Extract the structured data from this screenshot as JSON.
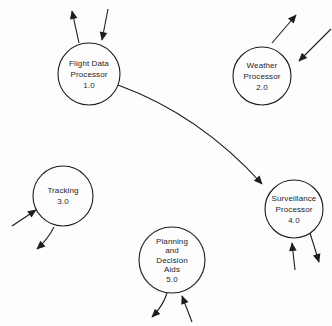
{
  "figure": {
    "width": 332,
    "height": 326,
    "background": "#fdfdfd",
    "ink": "#1d1d1d",
    "node_fill": "#fdfdfd",
    "stroke_width": 1.1,
    "font_size": 8
  },
  "diagram": {
    "type": "data-flow-diagram",
    "nodes": [
      {
        "id": "flight-data-processor",
        "lines": [
          "Flight Data",
          "Processor",
          "1.0"
        ],
        "x": 89,
        "y": 74,
        "r": 31
      },
      {
        "id": "weather-processor",
        "lines": [
          "Weather",
          "Processor",
          "2.0"
        ],
        "x": 262,
        "y": 76,
        "r": 29
      },
      {
        "id": "tracking",
        "lines": [
          "Tracking",
          "3.0"
        ],
        "x": 63,
        "y": 196,
        "r": 30
      },
      {
        "id": "surveillance-processor",
        "lines": [
          "Surveillance",
          "Processor",
          "4.0"
        ],
        "x": 294,
        "y": 209,
        "r": 29
      },
      {
        "id": "planning-decision-aids",
        "lines": [
          "Planning",
          "and",
          "Decision",
          "Aids",
          "5.0"
        ],
        "x": 172,
        "y": 260,
        "r": 33
      }
    ],
    "edges": [
      {
        "id": "flight-data-out-top",
        "from": [
          79,
          43
        ],
        "to": [
          72,
          11
        ],
        "ctrl": null
      },
      {
        "id": "flight-data-in-top",
        "from": [
          108,
          9
        ],
        "to": [
          102,
          40
        ],
        "ctrl": null
      },
      {
        "id": "flight-data-to-surveillance",
        "from": [
          118,
          85
        ],
        "to": [
          262,
          184
        ],
        "ctrl": [
          200,
          115
        ]
      },
      {
        "id": "weather-out-top",
        "from": [
          272,
          43
        ],
        "to": [
          296,
          15
        ],
        "ctrl": null
      },
      {
        "id": "weather-in-right",
        "from": [
          331,
          29
        ],
        "to": [
          299,
          61
        ],
        "ctrl": null
      },
      {
        "id": "tracking-in-left",
        "from": [
          12,
          226
        ],
        "to": [
          36,
          210
        ],
        "ctrl": null
      },
      {
        "id": "tracking-out-bottom",
        "from": [
          54,
          227
        ],
        "to": [
          37,
          249
        ],
        "ctrl": [
          48,
          239
        ]
      },
      {
        "id": "planning-out-bottom",
        "from": [
          167,
          293
        ],
        "to": [
          152,
          317
        ],
        "ctrl": [
          163,
          306
        ]
      },
      {
        "id": "planning-in-bottom",
        "from": [
          192,
          322
        ],
        "to": [
          182,
          296
        ],
        "ctrl": null
      },
      {
        "id": "surveillance-in-bottom",
        "from": [
          295,
          270
        ],
        "to": [
          292,
          243
        ],
        "ctrl": null
      },
      {
        "id": "surveillance-out-bottom",
        "from": [
          310,
          233
        ],
        "to": [
          319,
          262
        ],
        "ctrl": null
      }
    ]
  }
}
